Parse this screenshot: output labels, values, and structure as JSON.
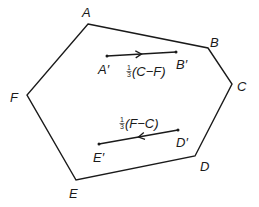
{
  "diagram": {
    "type": "hexagon-vectors",
    "stroke_color": "#1a1a1a",
    "background": "#ffffff",
    "vertices": [
      {
        "label": "A",
        "x": 88,
        "y": 24,
        "lx": 82,
        "ly": 17
      },
      {
        "label": "B",
        "x": 208,
        "y": 48,
        "lx": 210,
        "ly": 47
      },
      {
        "label": "C",
        "x": 232,
        "y": 84,
        "lx": 237,
        "ly": 91
      },
      {
        "label": "D",
        "x": 195,
        "y": 156,
        "lx": 200,
        "ly": 171
      },
      {
        "label": "E",
        "x": 76,
        "y": 180,
        "lx": 69,
        "ly": 198
      },
      {
        "label": "F",
        "x": 27,
        "y": 95,
        "lx": 10,
        "ly": 102
      }
    ],
    "vectors": [
      {
        "name": "upper-vector",
        "from": {
          "label": "A′",
          "x": 107,
          "y": 56,
          "lx": 98,
          "ly": 74
        },
        "to": {
          "label": "B′",
          "x": 176,
          "y": 52,
          "lx": 176,
          "ly": 69
        },
        "direction": "right",
        "expression": {
          "coef_num": "1",
          "coef_den": "3",
          "body": "(C−F)",
          "x": 127,
          "y": 76
        }
      },
      {
        "name": "lower-vector",
        "from": {
          "label": "D′",
          "x": 178,
          "y": 130,
          "lx": 176,
          "ly": 147
        },
        "to": {
          "label": "E′",
          "x": 99,
          "y": 144,
          "lx": 93,
          "ly": 162
        },
        "direction": "left",
        "expression": {
          "coef_num": "1",
          "coef_den": "3",
          "body": "(F−C)",
          "x": 120,
          "y": 128
        }
      }
    ]
  }
}
